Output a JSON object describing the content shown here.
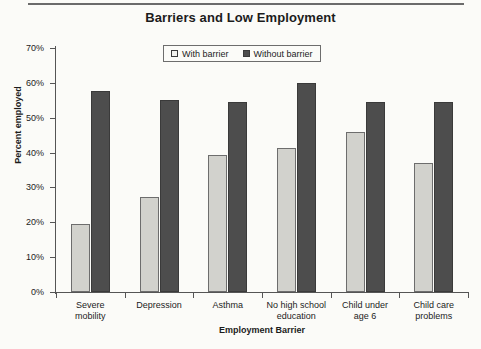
{
  "chart_data": {
    "type": "bar",
    "title": "Barriers and Low Employment",
    "xlabel": "Employment Barrier",
    "ylabel": "Percent employed",
    "ylim": [
      0,
      70
    ],
    "ytick_step": 10,
    "ytick_labels": [
      "0%",
      "10%",
      "20%",
      "30%",
      "40%",
      "50%",
      "60%",
      "70%"
    ],
    "ytick_values": [
      0,
      10,
      20,
      30,
      40,
      50,
      60,
      70
    ],
    "grid": false,
    "legend_position": "top-center",
    "categories": [
      "Severe mobility",
      "Depression",
      "Asthma",
      "No high school education",
      "Child under age 6",
      "Child care problems"
    ],
    "category_lines": [
      [
        "Severe",
        "mobility"
      ],
      [
        "Depression",
        ""
      ],
      [
        "Asthma",
        ""
      ],
      [
        "No high school",
        "education"
      ],
      [
        "Child under",
        "age 6"
      ],
      [
        "Child care",
        "problems"
      ]
    ],
    "series": [
      {
        "name": "With barrier",
        "color": "#d2d2cd",
        "values": [
          19.5,
          27.3,
          39.4,
          41.2,
          46.0,
          37.0
        ]
      },
      {
        "name": "Without barrier",
        "color": "#4d4d4d",
        "values": [
          57.7,
          55.0,
          54.4,
          60.0,
          54.5,
          54.4
        ]
      }
    ]
  },
  "legend": {
    "items": [
      {
        "label": "With barrier",
        "swatch": "open-square-swatch"
      },
      {
        "label": "Without barrier",
        "swatch": "filled-square-swatch"
      }
    ]
  },
  "colors": {
    "with_barrier": "#d2d2cd",
    "without_barrier": "#4d4d4d",
    "axis": "#555555",
    "text": "#1c1c1c",
    "background": "#fbfbf8"
  }
}
